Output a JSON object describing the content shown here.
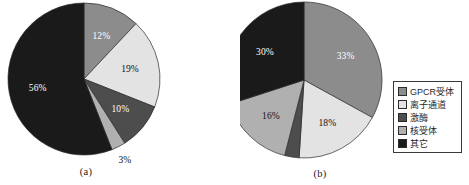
{
  "figure": {
    "background_color": "#ffffff",
    "captions": {
      "a": "(a)",
      "b": "(b)"
    }
  },
  "palette": {
    "gpcr": "#8c8c8c",
    "ion_channel": "#e3e3e3",
    "kinase": "#4d4d4d",
    "nuclear_receptor": "#b0b0b0",
    "other": "#1a1a1a",
    "outline": "#2b2b2b",
    "label_dark": "#111111",
    "label_light": "#ffffff"
  },
  "legend": {
    "position": "right",
    "border_color": "#3a3a3a",
    "items": [
      {
        "label": "GPCR受体",
        "color": "#8c8c8c"
      },
      {
        "label": "离子通道",
        "color": "#e3e3e3"
      },
      {
        "label": "激酶",
        "color": "#4d4d4d"
      },
      {
        "label": "核受体",
        "color": "#b0b0b0"
      },
      {
        "label": "其它",
        "color": "#1a1a1a"
      }
    ]
  },
  "chart_data": [
    {
      "type": "pie",
      "id": "a",
      "title": "",
      "caption": "(a)",
      "start_angle": 0,
      "direction": "clockwise",
      "categories": [
        "GPCR受体",
        "离子通道",
        "激酶",
        "核受体",
        "其它"
      ],
      "values": [
        12,
        19,
        10,
        3,
        56
      ],
      "data_labels": [
        "12%",
        "19%",
        "10%",
        "3%",
        "56%"
      ],
      "colors": [
        "#8c8c8c",
        "#e3e3e3",
        "#4d4d4d",
        "#b0b0b0",
        "#1a1a1a"
      ],
      "label_colors": [
        "#ffffff",
        "#111111",
        "#ffffff",
        "#111111",
        "#ffffff"
      ],
      "label_outside": [
        false,
        false,
        false,
        true,
        false
      ],
      "legend_position": "right",
      "grid": false
    },
    {
      "type": "pie",
      "id": "b",
      "title": "",
      "caption": "(b)",
      "start_angle": 0,
      "direction": "clockwise",
      "categories": [
        "GPCR受体",
        "离子通道",
        "激酶",
        "核受体",
        "其它"
      ],
      "values": [
        33,
        18,
        3,
        16,
        30
      ],
      "data_labels": [
        "33%",
        "18%",
        "3%",
        "16%",
        "30%"
      ],
      "colors": [
        "#8c8c8c",
        "#e3e3e3",
        "#4d4d4d",
        "#b0b0b0",
        "#1a1a1a"
      ],
      "label_colors": [
        "#ffffff",
        "#111111",
        "#111111",
        "#111111",
        "#ffffff"
      ],
      "label_outside": [
        false,
        false,
        true,
        false,
        false
      ],
      "legend_position": "right",
      "grid": false
    }
  ]
}
